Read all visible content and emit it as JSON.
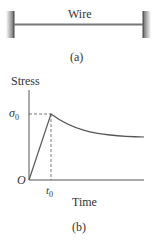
{
  "panel_a": {
    "wire_label": "Wire",
    "caption": "(a)"
  },
  "panel_b": {
    "y_axis_label": "Stress",
    "x_axis_label": "Time",
    "origin_label": "O",
    "sigma_label": "σ",
    "sigma_sub": "0",
    "t_label": "t",
    "t_sub": "0",
    "caption": "(b)"
  },
  "colors": {
    "line": "#555555",
    "text": "#333333"
  }
}
